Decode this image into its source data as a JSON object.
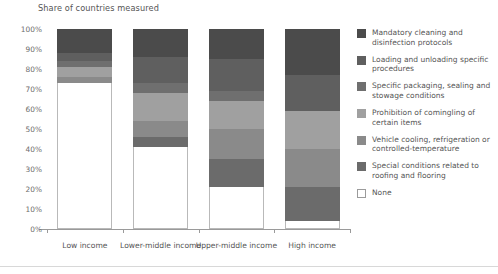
{
  "chart_data": {
    "type": "bar",
    "title": "Share of countries measured",
    "subtitle": "",
    "xlabel": "",
    "ylabel": "",
    "ylim": [
      0,
      100
    ],
    "ytick_labels": [
      "100%",
      "90%",
      "80%",
      "70%",
      "60%",
      "50%",
      "40%",
      "30%",
      "20%",
      "10%",
      "0%"
    ],
    "ytick_values": [
      100,
      90,
      80,
      70,
      60,
      50,
      40,
      30,
      20,
      10,
      0
    ],
    "grid": false,
    "stacked": true,
    "legend_position": "right",
    "categories": [
      "Low income",
      "Lower-middle income",
      "Upper-middle income",
      "High income"
    ],
    "series": [
      {
        "name": "Mandatory cleaning and disinfection protocols",
        "color": "#4b4b4b",
        "values": [
          12,
          14,
          15,
          23
        ]
      },
      {
        "name": "Loading and unloading specific procedures",
        "color": "#5f5f5f",
        "values": [
          4,
          13,
          16,
          18
        ]
      },
      {
        "name": "Specific packaging, sealing and stowage conditions",
        "color": "#6f6f6f",
        "values": [
          3,
          5,
          5,
          0
        ]
      },
      {
        "name": "Prohibition of comingling of certain items",
        "color": "#a0a0a0",
        "values": [
          5,
          14,
          14,
          19
        ]
      },
      {
        "name": "Vehicle cooling, refrigeration or controlled-temperature",
        "color": "#8a8a8a",
        "values": [
          3,
          8,
          15,
          19
        ]
      },
      {
        "name": "Special conditions related to roofing and flooring",
        "color": "#6b6b6b",
        "values": [
          0,
          5,
          14,
          17
        ]
      },
      {
        "name": "None",
        "color": "#ffffff",
        "values": [
          73,
          41,
          21,
          4
        ]
      }
    ]
  },
  "axis": {
    "baseline_color": "#9a9a9a"
  }
}
